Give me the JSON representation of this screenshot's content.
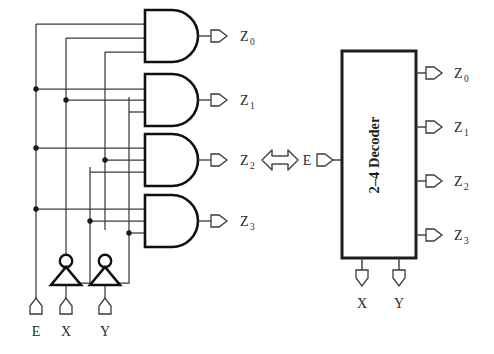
{
  "figure": {
    "background_color": "#ffffff",
    "line_color": "#3a3a3a",
    "gate_color": "#101010",
    "text_color": "#2a2a2a"
  },
  "equivalence": {
    "symbol_name": "double-headed-arrow",
    "glyph": "⟺"
  },
  "gate_level": {
    "caption": "Gate-level realization of a 2-to-4 decoder with enable",
    "inputs": [
      {
        "name": "E",
        "label": "E",
        "x": 36
      },
      {
        "name": "X",
        "label": "X",
        "x": 66
      },
      {
        "name": "Y",
        "label": "Y",
        "x": 105
      }
    ],
    "inverters": [
      {
        "name": "inverter-x",
        "input": "X",
        "output": "X'"
      },
      {
        "name": "inverter-y",
        "input": "Y",
        "output": "Y'"
      }
    ],
    "and_gates": [
      {
        "name": "and-gate-z0",
        "output_label": "Z",
        "output_sub": "0",
        "inputs": [
          "E",
          "X'",
          "Y'"
        ]
      },
      {
        "name": "and-gate-z1",
        "output_label": "Z",
        "output_sub": "1",
        "inputs": [
          "E",
          "X'",
          "Y"
        ]
      },
      {
        "name": "and-gate-z2",
        "output_label": "Z",
        "output_sub": "2",
        "inputs": [
          "E",
          "X",
          "Y'"
        ]
      },
      {
        "name": "and-gate-z3",
        "output_label": "Z",
        "output_sub": "3",
        "inputs": [
          "E",
          "X",
          "Y"
        ]
      }
    ]
  },
  "block_level": {
    "box_label": "2–4 Decoder",
    "enable_input": {
      "name": "E",
      "label": "E"
    },
    "bottom_inputs": [
      {
        "name": "X",
        "label": "X"
      },
      {
        "name": "Y",
        "label": "Y"
      }
    ],
    "outputs": [
      {
        "name": "Z0",
        "label": "Z",
        "sub": "0"
      },
      {
        "name": "Z1",
        "label": "Z",
        "sub": "1"
      },
      {
        "name": "Z2",
        "label": "Z",
        "sub": "2"
      },
      {
        "name": "Z3",
        "label": "Z",
        "sub": "3"
      }
    ]
  }
}
